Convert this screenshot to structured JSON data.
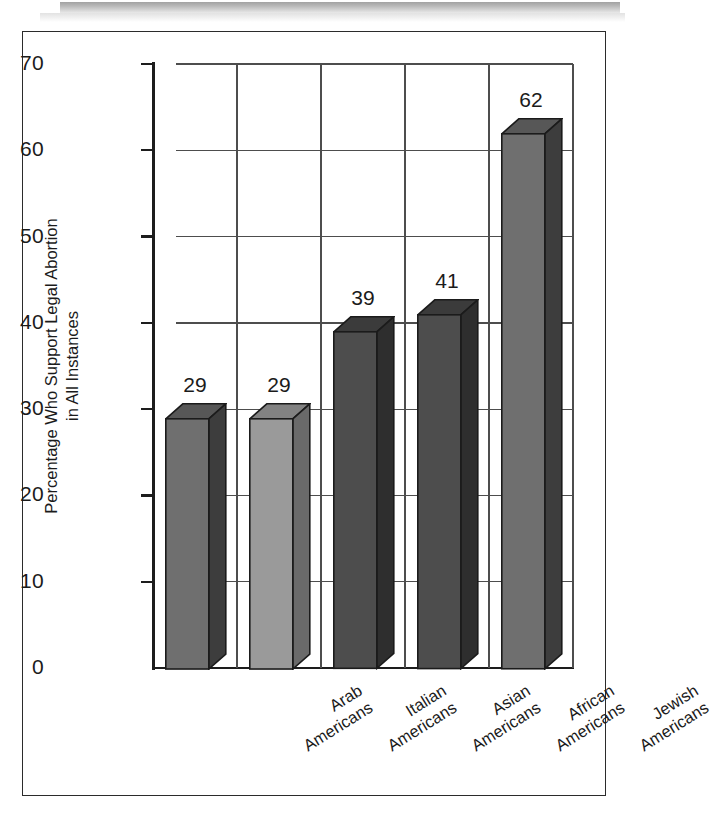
{
  "figure": {
    "frame": true,
    "scan_artifact": true
  },
  "chart_data": {
    "type": "bar",
    "title": "",
    "xlabel": "",
    "ylabel": "Percentage Who Support Legal Abortion in All Instances",
    "ylabel_line1": "Percentage Who Support Legal Abortion",
    "ylabel_line2": "in All Instances",
    "categories": [
      "Arab Americans",
      "Italian Americans",
      "Asian Americans",
      "African Americans",
      "Jewish Americans"
    ],
    "category_lines": [
      [
        "Arab",
        "Americans"
      ],
      [
        "Italian",
        "Americans"
      ],
      [
        "Asian",
        "Americans"
      ],
      [
        "African",
        "Americans"
      ],
      [
        "Jewish",
        "Americans"
      ]
    ],
    "values": [
      29,
      29,
      39,
      41,
      62
    ],
    "value_labels": [
      "29",
      "29",
      "39",
      "41",
      "62"
    ],
    "ylim": [
      0,
      70
    ],
    "yticks": [
      0,
      10,
      20,
      30,
      40,
      50,
      60,
      70
    ],
    "ytick_labels": [
      "0",
      "10",
      "20",
      "30",
      "40",
      "50",
      "60",
      "70"
    ],
    "grid": "both",
    "legend": "none",
    "style": "3d-bars",
    "bar_colors": [
      "#6f6f6f",
      "#9a9a9a",
      "#4d4d4d",
      "#4d4d4d",
      "#6f6f6f"
    ],
    "bar_side_colors": [
      "#3d3d3d",
      "#6a6a6a",
      "#2e2e2e",
      "#2e2e2e",
      "#3d3d3d"
    ],
    "bar_top_colors": [
      "#575757",
      "#828282",
      "#3b3b3b",
      "#3b3b3b",
      "#575757"
    ],
    "outline_color": "#1b1b1b"
  }
}
